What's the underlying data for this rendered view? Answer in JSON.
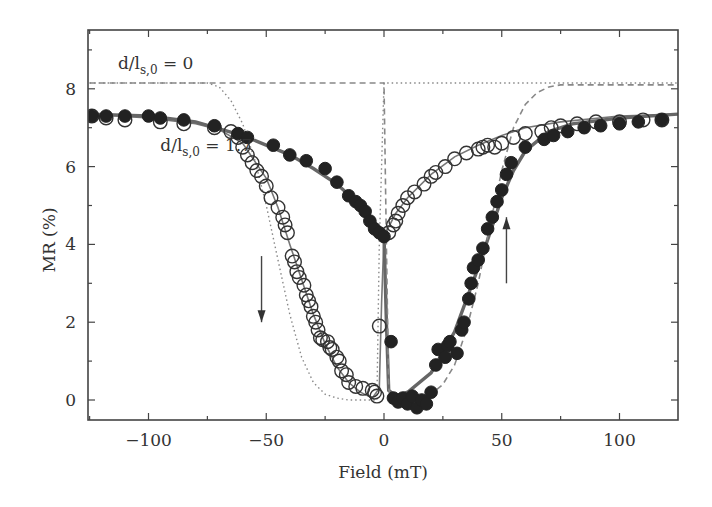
{
  "chart_data": {
    "type": "scatter",
    "title": "",
    "xlabel": "Field (mT)",
    "ylabel": "MR (%)",
    "xlim": [
      -125,
      125
    ],
    "ylim": [
      -0.6,
      9.4
    ],
    "xticks": [
      -100,
      -50,
      0,
      50,
      100
    ],
    "xtick_labels": [
      "−100",
      "−50",
      "0",
      "50",
      "100"
    ],
    "yticks": [
      0,
      2,
      4,
      6,
      8
    ],
    "ytick_labels": [
      "0",
      "2",
      "4",
      "6",
      "8"
    ],
    "grid": false,
    "legend": null,
    "annotations": [
      {
        "text_main": "d/l",
        "text_sub": "s,0",
        "text_tail": " = 0",
        "x": -113,
        "y": 8.5
      },
      {
        "text_main": "d/l",
        "text_sub": "s,0",
        "text_tail": " = 1.7",
        "x": -95,
        "y": 6.4
      },
      {
        "type": "arrow-down",
        "x": -52,
        "y_from": 3.7,
        "y_to": 2.0,
        "meaning": "sweep down"
      },
      {
        "type": "arrow-up",
        "x": 52,
        "y_from": 3.0,
        "y_to": 4.7,
        "meaning": "sweep up"
      }
    ],
    "series": [
      {
        "name": "open circles (sweep down, data)",
        "marker": "open-circle",
        "x": [
          -124,
          -118,
          -110,
          -95,
          -85,
          -72,
          -65,
          -62,
          -60,
          -58,
          -56,
          -54,
          -52,
          -50,
          -48,
          -45,
          -43,
          -42,
          -41,
          -39,
          -38,
          -37,
          -36,
          -34,
          -33,
          -32,
          -31,
          -30,
          -29,
          -28,
          -27,
          -26,
          -24,
          -23,
          -22,
          -20,
          -19,
          -18,
          -16,
          -15,
          -12,
          -9,
          -5,
          -4,
          -3,
          -2,
          2,
          4,
          5,
          6,
          8,
          10,
          13,
          17,
          20,
          22,
          26,
          30,
          35,
          40,
          42,
          44,
          47,
          50,
          55,
          60,
          67,
          71,
          75,
          82,
          90,
          100,
          110,
          118
        ],
        "y": [
          7.3,
          7.25,
          7.2,
          7.15,
          7.1,
          7.0,
          6.9,
          6.75,
          6.5,
          6.3,
          6.1,
          5.9,
          5.75,
          5.5,
          5.2,
          4.95,
          4.7,
          4.5,
          4.3,
          3.7,
          3.55,
          3.3,
          3.15,
          2.95,
          2.7,
          2.55,
          2.4,
          2.15,
          2.0,
          1.8,
          1.6,
          1.55,
          1.5,
          1.35,
          1.3,
          1.1,
          1.0,
          0.75,
          0.65,
          0.45,
          0.35,
          0.3,
          0.25,
          0.2,
          0.1,
          1.9,
          4.3,
          4.5,
          4.6,
          4.8,
          5.0,
          5.2,
          5.35,
          5.55,
          5.75,
          5.85,
          6.0,
          6.2,
          6.35,
          6.45,
          6.5,
          6.55,
          6.5,
          6.6,
          6.75,
          6.85,
          6.9,
          7.0,
          7.05,
          7.1,
          7.15,
          7.15,
          7.2,
          7.2
        ]
      },
      {
        "name": "filled circles (sweep up, data)",
        "marker": "filled-circle",
        "x": [
          -124,
          -118,
          -110,
          -100,
          -95,
          -85,
          -72,
          -62,
          -58,
          -47,
          -40,
          -33,
          -25,
          -20,
          -15,
          -12,
          -10,
          -8,
          -6,
          -4,
          -2,
          0,
          3,
          4,
          6,
          8,
          10,
          12,
          14,
          16,
          18,
          20,
          22,
          23,
          26,
          27,
          28,
          31,
          33,
          34,
          36,
          37,
          38,
          40,
          42,
          44,
          46,
          48,
          50,
          52,
          54,
          60,
          68,
          72,
          78,
          85,
          92,
          100,
          108,
          118
        ],
        "y": [
          7.3,
          7.3,
          7.3,
          7.3,
          7.25,
          7.2,
          7.05,
          6.85,
          6.75,
          6.55,
          6.3,
          6.15,
          5.95,
          5.6,
          5.25,
          5.1,
          5.0,
          4.85,
          4.6,
          4.4,
          4.3,
          4.2,
          1.5,
          0.05,
          -0.05,
          0.05,
          -0.1,
          0.1,
          -0.2,
          0.0,
          -0.1,
          0.2,
          0.9,
          1.3,
          1.1,
          1.4,
          1.5,
          1.2,
          1.8,
          2.0,
          2.6,
          3.0,
          3.4,
          3.6,
          3.9,
          4.4,
          4.7,
          5.1,
          5.4,
          5.8,
          6.1,
          6.5,
          6.7,
          6.8,
          6.9,
          7.0,
          7.05,
          7.1,
          7.15,
          7.2
        ]
      },
      {
        "name": "fit d/l_s,0 = 1.7 (sweep down)",
        "line": "solid-thin",
        "x": [
          -125,
          -100,
          -80,
          -70,
          -60,
          -50,
          -45,
          -40,
          -35,
          -30,
          -25,
          -20,
          -15,
          -10,
          -5,
          -2,
          -1,
          0,
          2,
          5,
          10,
          20,
          30,
          40,
          50,
          60,
          75,
          100,
          125
        ],
        "y": [
          7.35,
          7.25,
          7.1,
          6.95,
          6.6,
          5.7,
          4.95,
          4.0,
          3.1,
          2.2,
          1.45,
          0.85,
          0.45,
          0.2,
          0.05,
          0.3,
          2.5,
          4.2,
          4.45,
          4.8,
          5.2,
          5.8,
          6.25,
          6.55,
          6.8,
          7.0,
          7.15,
          7.3,
          7.35
        ]
      },
      {
        "name": "fit d/l_s,0 = 1.7 (sweep up)",
        "line": "solid-thick",
        "x": [
          -125,
          -100,
          -80,
          -60,
          -40,
          -30,
          -20,
          -10,
          -5,
          -2,
          0,
          1,
          2,
          5,
          10,
          20,
          30,
          40,
          45,
          50,
          55,
          60,
          70,
          80,
          100,
          125
        ],
        "y": [
          7.35,
          7.3,
          7.15,
          6.8,
          6.3,
          5.95,
          5.55,
          5.0,
          4.65,
          4.4,
          4.25,
          2.0,
          0.25,
          0.1,
          0.2,
          0.7,
          1.75,
          3.4,
          4.3,
          5.2,
          5.9,
          6.4,
          6.9,
          7.1,
          7.25,
          7.35
        ]
      },
      {
        "name": "d/l_s,0 = 0 (sweep down)",
        "line": "dotted",
        "x": [
          -125,
          -75,
          -70,
          -65,
          -60,
          -55,
          -50,
          -45,
          -40,
          -35,
          -30,
          -25,
          -20,
          -15,
          -10,
          -5,
          -3,
          -2,
          0,
          125
        ],
        "y": [
          8.15,
          8.15,
          8.05,
          7.7,
          7.1,
          6.2,
          5.0,
          3.6,
          2.2,
          1.1,
          0.45,
          0.15,
          0.05,
          0.0,
          0.0,
          0.0,
          0.0,
          4.0,
          8.15,
          8.15
        ]
      },
      {
        "name": "d/l_s,0 = 0 (sweep up)",
        "line": "dashed",
        "x": [
          -125,
          -3,
          0,
          1,
          2,
          3,
          5,
          10,
          15,
          20,
          25,
          30,
          35,
          40,
          45,
          50,
          55,
          60,
          65,
          70,
          75,
          125
        ],
        "y": [
          8.15,
          8.15,
          8.15,
          4.0,
          0.3,
          0.0,
          0.0,
          0.0,
          0.05,
          0.15,
          0.4,
          0.9,
          1.8,
          3.0,
          4.5,
          5.9,
          7.0,
          7.6,
          7.9,
          8.05,
          8.1,
          8.1
        ]
      }
    ]
  }
}
